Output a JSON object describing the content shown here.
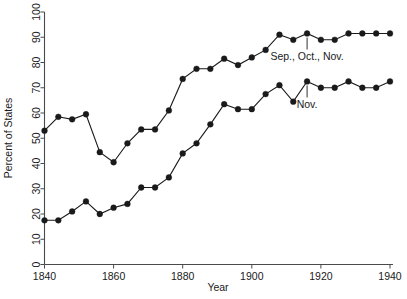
{
  "chart_data": {
    "type": "line",
    "title": "",
    "xlabel": "Year",
    "ylabel": "Percent of States",
    "xlim": [
      1836,
      1944
    ],
    "ylim": [
      0,
      100
    ],
    "grid": false,
    "legend_position": "inline-annotations",
    "xticks": [
      1840,
      1860,
      1880,
      1900,
      1920,
      1940
    ],
    "xtick_labels": [
      "1840",
      "1860",
      "1880",
      "1900",
      "1920",
      "1940"
    ],
    "yticks": [
      0,
      10,
      20,
      30,
      40,
      50,
      60,
      70,
      80,
      90,
      100
    ],
    "ytick_labels": [
      "0",
      "10",
      "20",
      "30",
      "40",
      "50",
      "60",
      "70",
      "80",
      "90",
      "100"
    ],
    "x": [
      1840,
      1844,
      1848,
      1852,
      1856,
      1860,
      1864,
      1868,
      1872,
      1876,
      1880,
      1884,
      1888,
      1892,
      1896,
      1900,
      1904,
      1908,
      1912,
      1916,
      1920,
      1924,
      1928,
      1932,
      1936,
      1940
    ],
    "series": [
      {
        "name": "Sep., Oct., Nov.",
        "marker": "filled-circle",
        "values": [
          53,
          58.5,
          57.5,
          59.5,
          44.5,
          40.5,
          48,
          53.5,
          53.5,
          61,
          73.5,
          77.5,
          77.5,
          81.5,
          79,
          82,
          85,
          91,
          89,
          91.5,
          89,
          89,
          91.5,
          91.5,
          91.5,
          91.5
        ]
      },
      {
        "name": "Nov.",
        "marker": "filled-circle",
        "values": [
          17.5,
          17.5,
          21,
          25,
          20,
          22.5,
          24,
          30.5,
          30.5,
          34.5,
          44,
          48,
          55.5,
          63.5,
          61.5,
          61.5,
          67.5,
          71,
          64.5,
          72.5,
          70,
          70,
          72.5,
          70,
          70,
          72.5
        ]
      }
    ],
    "annotations": [
      {
        "text": "Sep., Oct., Nov.",
        "points_to_year": 1916,
        "points_to_value": 91.5
      },
      {
        "text": "Nov.",
        "points_to_year": 1916,
        "points_to_value": 72.5
      }
    ]
  }
}
